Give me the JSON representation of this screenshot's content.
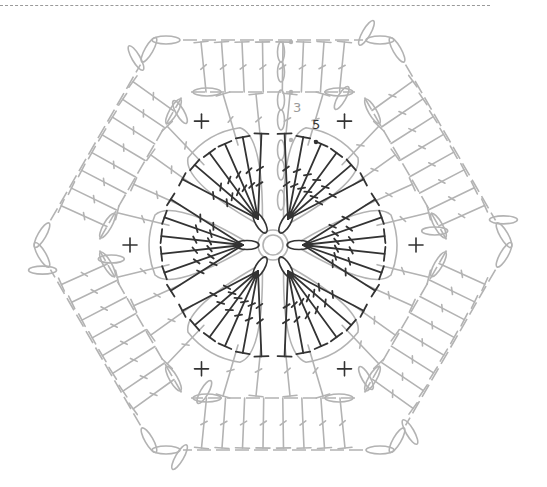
{
  "diagram": {
    "type": "crochet-chart",
    "shape": "hexagon",
    "repeats": 6,
    "colors": {
      "previous_rounds": "#b3b3b3",
      "current_rounds": "#333333",
      "labels": "#9a9a9a",
      "label_dark": "#333333",
      "background": "#ffffff"
    },
    "round_labels": [
      {
        "text": "3",
        "tone": "light"
      },
      {
        "text": "5",
        "tone": "dark"
      }
    ],
    "symbols": {
      "center": "magic-ring",
      "petal_stitch": "treble-crochet",
      "corner_mark": "single-crochet",
      "outer_stitch": "double-crochet",
      "chain": "chain-stitch",
      "slip": "slip-stitch"
    }
  }
}
